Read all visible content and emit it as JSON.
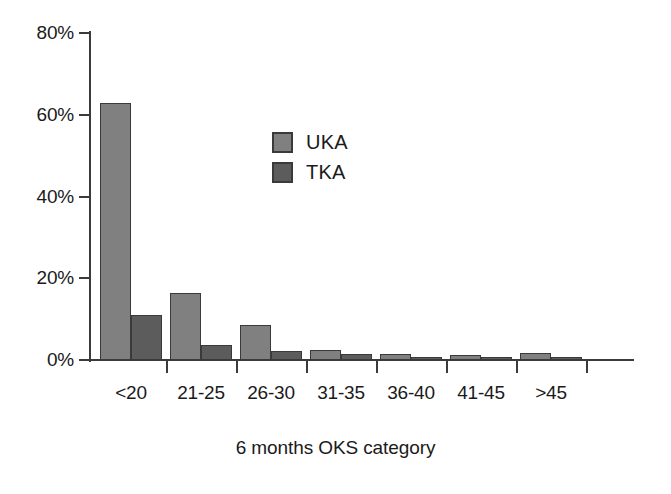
{
  "chart_data": {
    "type": "bar",
    "title": "",
    "subtitle": "",
    "xlabel": "6 months OKS category",
    "ylabel": "",
    "categories": [
      "<20",
      "21-25",
      "26-30",
      "31-35",
      "36-40",
      "41-45",
      ">45"
    ],
    "series": [
      {
        "name": "UKA",
        "color": "#808080",
        "values": [
          62.8,
          16.4,
          8.6,
          2.4,
          1.4,
          1.3,
          1.7
        ]
      },
      {
        "name": "TKA",
        "color": "#5c5c5c",
        "values": [
          11.0,
          3.7,
          2.2,
          1.4,
          0.6,
          0.5,
          0.5
        ]
      }
    ],
    "ylim": [
      0,
      80
    ],
    "yticks": [
      0,
      20,
      40,
      60,
      80
    ],
    "ytick_labels": [
      "0%",
      "20%",
      "40%",
      "60%",
      "80%"
    ],
    "grid": false,
    "legend_position": "inside-upper-center",
    "value_unit": "%"
  },
  "legend": {
    "items": [
      {
        "label": "UKA",
        "key": "uka"
      },
      {
        "label": "TKA",
        "key": "tka"
      }
    ]
  }
}
